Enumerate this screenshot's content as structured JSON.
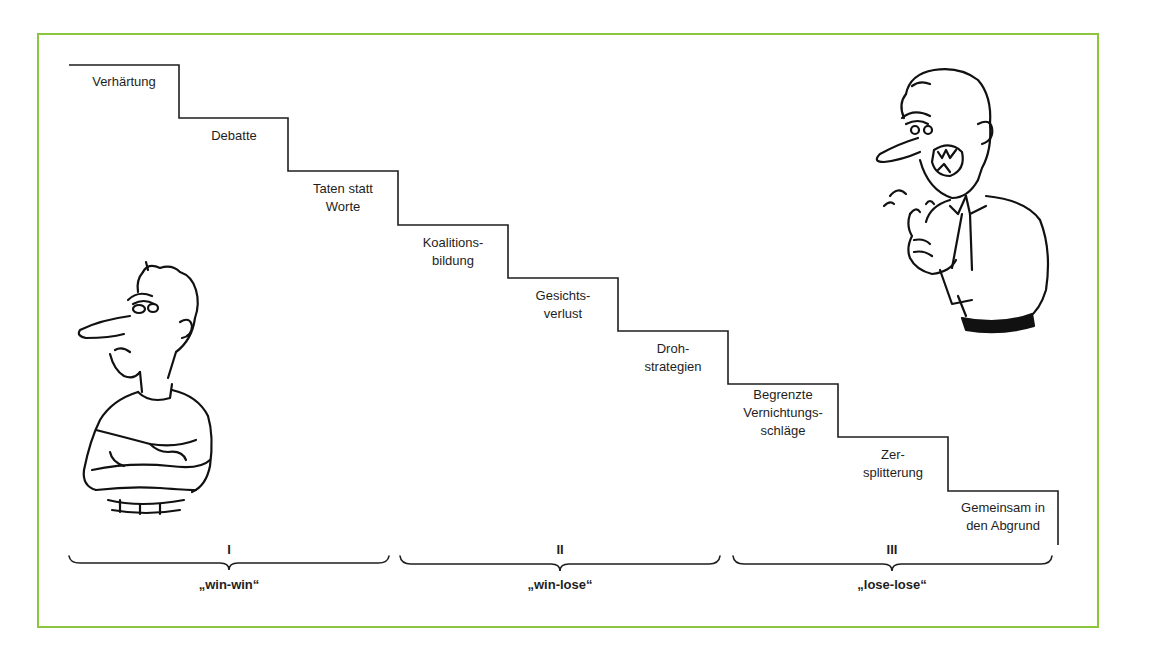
{
  "diagram": {
    "type": "staircase",
    "accent_color": "#8cc63f",
    "line_color": "#1e1e1e",
    "steps": [
      {
        "level": 1,
        "label": "Verhärtung"
      },
      {
        "level": 2,
        "label": "Debatte"
      },
      {
        "level": 3,
        "label": "Taten statt\nWorte"
      },
      {
        "level": 4,
        "label": "Koalitions-\nbildung"
      },
      {
        "level": 5,
        "label": "Gesichts-\nverlust"
      },
      {
        "level": 6,
        "label": "Droh-\nstrategien"
      },
      {
        "level": 7,
        "label": "Begrenzte\nVernichtungs-\nschläge"
      },
      {
        "level": 8,
        "label": "Zer-\nsplitterung"
      },
      {
        "level": 9,
        "label": "Gemeinsam in\nden Abgrund"
      }
    ],
    "phases": [
      {
        "numeral": "I",
        "label": "„win-win“",
        "steps": [
          1,
          2,
          3
        ]
      },
      {
        "numeral": "II",
        "label": "„win-lose“",
        "steps": [
          4,
          5,
          6
        ]
      },
      {
        "numeral": "III",
        "label": "„lose-lose“",
        "steps": [
          7,
          8,
          9
        ]
      }
    ],
    "figures": [
      {
        "name": "calm-man",
        "description": "man with crossed arms, sulking"
      },
      {
        "name": "angry-man",
        "description": "man shouting, pointing finger"
      }
    ]
  }
}
